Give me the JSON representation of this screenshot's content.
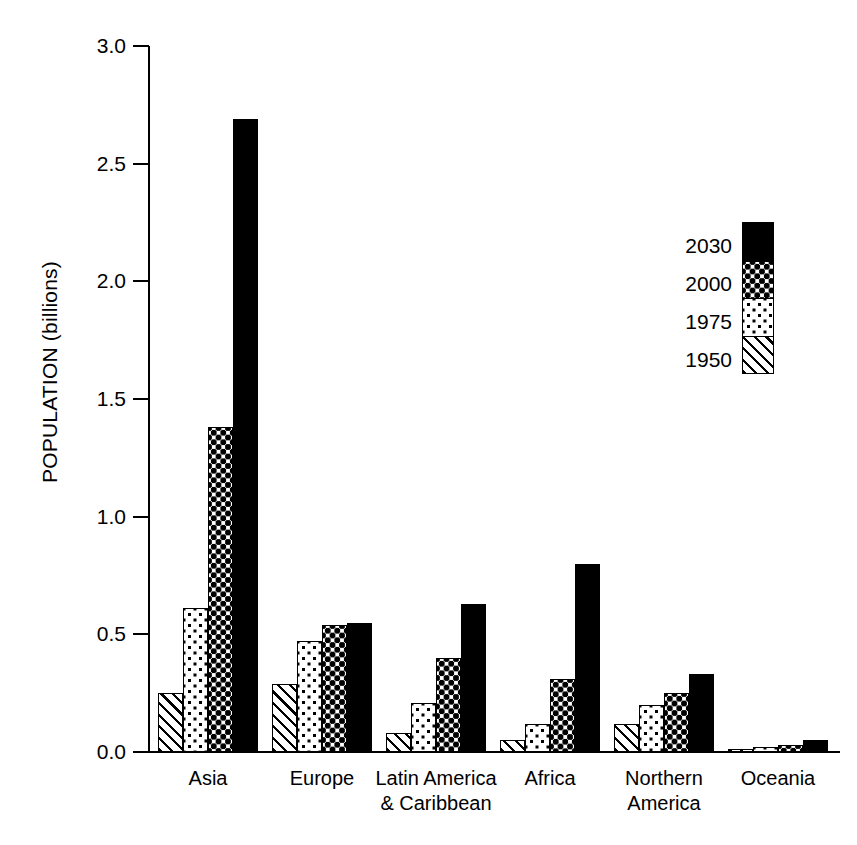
{
  "chart_data": {
    "type": "bar",
    "title": "",
    "xlabel": "",
    "ylabel": "POPULATION (billions)",
    "ylim": [
      0.0,
      3.0
    ],
    "yticks": [
      "0.0",
      "0.5",
      "1.0",
      "1.5",
      "2.0",
      "2.5",
      "3.0"
    ],
    "ytick_values": [
      0.0,
      0.5,
      1.0,
      1.5,
      2.0,
      2.5,
      3.0
    ],
    "grid": false,
    "legend_position": "upper right (inside plot)",
    "categories": [
      "Asia",
      "Europe",
      "Latin America\n& Caribbean",
      "Africa",
      "Northern\nAmerica",
      "Oceania"
    ],
    "series": [
      {
        "name": "1950",
        "pattern": "diagonal-hatch",
        "values": [
          0.25,
          0.29,
          0.08,
          0.05,
          0.12,
          0.01
        ]
      },
      {
        "name": "1975",
        "pattern": "sparse-dots",
        "values": [
          0.61,
          0.47,
          0.21,
          0.12,
          0.2,
          0.02
        ]
      },
      {
        "name": "2000",
        "pattern": "dense-checker",
        "values": [
          1.38,
          0.54,
          0.4,
          0.31,
          0.25,
          0.03
        ]
      },
      {
        "name": "2030",
        "pattern": "solid-black",
        "values": [
          2.69,
          0.55,
          0.63,
          0.8,
          0.33,
          0.05
        ]
      }
    ]
  },
  "legend": {
    "entries": [
      {
        "label": "2030",
        "pattern": "solid-black"
      },
      {
        "label": "2000",
        "pattern": "dense-checker"
      },
      {
        "label": "1975",
        "pattern": "sparse-dots"
      },
      {
        "label": "1950",
        "pattern": "diagonal-hatch"
      }
    ]
  },
  "colors": {
    "foreground": "#000000",
    "background": "#ffffff"
  }
}
